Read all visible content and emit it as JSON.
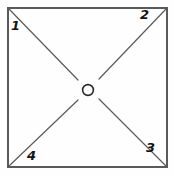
{
  "figure": {
    "type": "square-with-diagonals",
    "background_color": "#fefefe",
    "stroke_color": "#5a5a5a",
    "label_color": "#141414",
    "square": {
      "x": 8,
      "y": 8,
      "width": 159,
      "height": 159,
      "stroke_width": 1.4
    },
    "center_marker": {
      "name": "center-circle",
      "cx": 88,
      "cy": 90,
      "r": 5.4,
      "stroke_width": 1.6
    },
    "diagonals": [
      {
        "name": "diagonal-top-left-to-center",
        "x1": 9,
        "y1": 9,
        "x2": 78,
        "y2": 80
      },
      {
        "name": "diagonal-top-right-to-center",
        "x1": 166,
        "y1": 9,
        "x2": 99,
        "y2": 79
      },
      {
        "name": "diagonal-bottom-right-to-center",
        "x1": 166,
        "y1": 166,
        "x2": 99,
        "y2": 99
      },
      {
        "name": "diagonal-bottom-left-to-center",
        "x1": 9,
        "y1": 166,
        "x2": 78,
        "y2": 100
      }
    ],
    "labels": {
      "top_left": "1",
      "top_right": "2",
      "bottom_right": "3",
      "bottom_left": "4"
    }
  }
}
